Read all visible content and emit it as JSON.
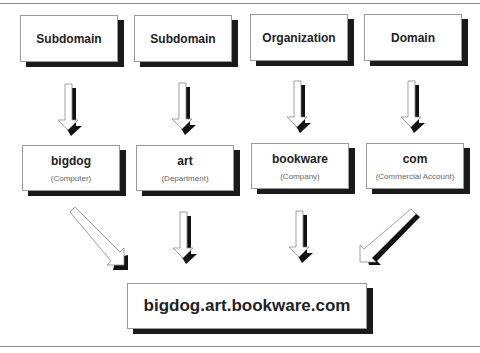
{
  "levels": [
    {
      "label": "Subdomain",
      "value": "bigdog",
      "desc": "(Computer)"
    },
    {
      "label": "Subdomain",
      "value": "art",
      "desc": "(Department)"
    },
    {
      "label": "Organization",
      "value": "bookware",
      "desc": "(Company)"
    },
    {
      "label": "Domain",
      "value": "com",
      "desc": "(Commercial Account)"
    }
  ],
  "result": "bigdog.art.bookware.com"
}
